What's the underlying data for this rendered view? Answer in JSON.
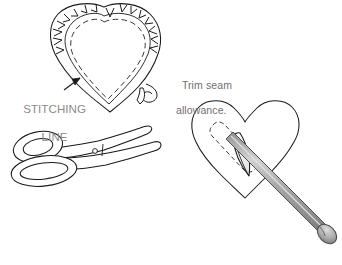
{
  "illustration": {
    "title": "Sewing heart pattern: trim seam allowance and turn right side out",
    "type": "line-drawing",
    "background_color": "#ffffff",
    "ink_color": "#1a1a1a",
    "tool_gray": "#9a9a9a",
    "label_gray": "#8a8a8a"
  },
  "labels": {
    "stitching_line": {
      "line1": "STITCHING",
      "line2": "LINE",
      "color": "#8a8a8a",
      "points_to": "dashed-stitching-line-on-left-heart"
    },
    "trim_seam": {
      "line1": "Trim seam",
      "line2": "allowance.",
      "color": "#6f6f6f",
      "points_to": "notched-seam-allowance-edge"
    }
  },
  "figures": {
    "left_heart": {
      "name": "notched-heart-with-seam-allowance",
      "description": "Heart shape with dashed stitching line inside and clipped V notches around the upper curved seam allowance",
      "notch_count": 14,
      "stitch_style": "dashed"
    },
    "scissors": {
      "name": "scissors",
      "description": "Open scissors, two oval finger loops at lower-left, blades angled up to the right, pivot screw at center",
      "loops": 2
    },
    "right_heart": {
      "name": "heart-with-turning-tool",
      "description": "Heart shape with a dashed slit opening and a gray turning dowel pushed through the opening",
      "slit_style": "dashed",
      "tool": "turning-dowel-with-rounded-knob"
    }
  },
  "colors": {
    "ink": "#1a1a1a",
    "tool_light": "#c9c9c9",
    "tool_mid": "#a6a6a6",
    "tool_dark": "#8c8c8c",
    "paper": "#ffffff"
  }
}
